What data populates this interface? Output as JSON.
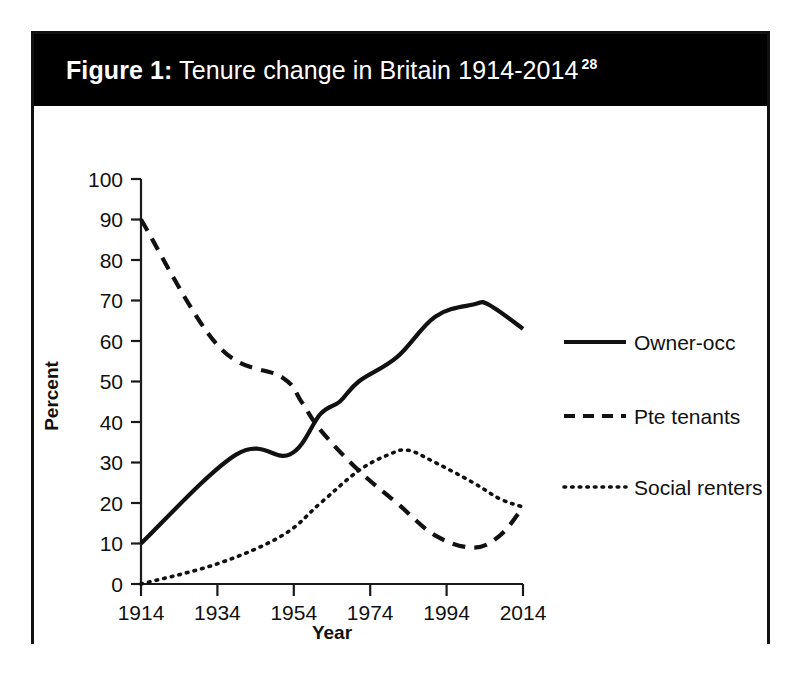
{
  "figure": {
    "label": "Figure 1:",
    "title": " Tenure change in Britain 1914-2014",
    "footnote_marker": "28",
    "full_title": "Figure 1: Tenure change in Britain 1914-2014 28"
  },
  "chart_data": {
    "type": "line",
    "title": "Figure 1: Tenure change in Britain 1914-2014",
    "xlabel": "Year",
    "ylabel": "Percent",
    "xlim": [
      1914,
      2014
    ],
    "ylim": [
      0,
      100
    ],
    "grid": false,
    "legend_position": "right",
    "xticks": [
      1914,
      1934,
      1954,
      1974,
      1994,
      2014
    ],
    "xtick_labels": [
      "1914",
      "1934",
      "1954",
      "1974",
      "1994",
      "2014"
    ],
    "yticks": [
      0,
      10,
      20,
      30,
      40,
      50,
      60,
      70,
      80,
      90,
      100
    ],
    "ytick_labels": [
      "0",
      "10",
      "20",
      "30",
      "40",
      "50",
      "60",
      "70",
      "80",
      "90",
      "100"
    ],
    "series": [
      {
        "name": "Owner-occ",
        "style": "solid",
        "color": "#111111",
        "x": [
          1914,
          1939,
          1953,
          1961,
          1966,
          1971,
          1981,
          1991,
          2001,
          2005,
          2014
        ],
        "values": [
          10,
          32,
          32,
          42,
          45,
          50,
          56,
          66,
          69,
          69,
          63
        ]
      },
      {
        "name": "Pte tenants",
        "style": "dashed",
        "color": "#111111",
        "x": [
          1914,
          1934,
          1951,
          1956,
          1961,
          1971,
          1981,
          1991,
          2001,
          2008,
          2014
        ],
        "values": [
          90,
          59,
          51,
          45,
          38,
          28,
          20,
          12,
          9,
          12,
          19
        ]
      },
      {
        "name": "Social renters",
        "style": "dotted",
        "color": "#111111",
        "x": [
          1914,
          1934,
          1951,
          1961,
          1971,
          1979,
          1984,
          1991,
          2001,
          2008,
          2014
        ],
        "values": [
          0,
          5,
          12,
          20,
          28,
          32,
          33,
          30,
          25,
          21,
          19
        ]
      }
    ],
    "annotations": []
  },
  "legend": {
    "items": [
      {
        "label": "Owner-occ",
        "style": "solid"
      },
      {
        "label": "Pte tenants",
        "style": "dashed"
      },
      {
        "label": "Social renters",
        "style": "dotted"
      }
    ]
  }
}
